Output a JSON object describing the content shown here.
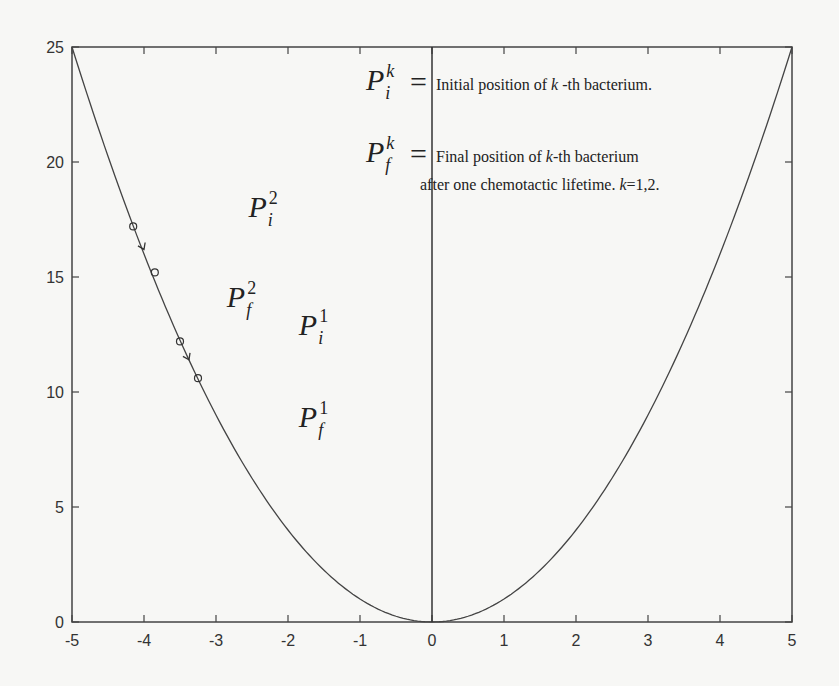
{
  "chart_data": {
    "type": "line",
    "title": "",
    "xlabel": "",
    "ylabel": "",
    "xlim": [
      -5,
      5
    ],
    "ylim": [
      0,
      25
    ],
    "grid": false,
    "x_ticks": [
      "-5",
      "-4",
      "-3",
      "-2",
      "-1",
      "0",
      "1",
      "2",
      "3",
      "4",
      "5"
    ],
    "y_ticks": [
      "0",
      "5",
      "10",
      "15",
      "20",
      "25"
    ],
    "series": [
      {
        "name": "f(x) = x^2",
        "function": "x^2",
        "x": [
          -5,
          -4,
          -3,
          -2,
          -1,
          0,
          1,
          2,
          3,
          4,
          5
        ],
        "values": [
          25,
          16,
          9,
          4,
          1,
          0,
          1,
          4,
          9,
          16,
          25
        ]
      }
    ],
    "vertical_line_x": 0,
    "bacteria_markers": [
      {
        "id": 2,
        "initial": {
          "x": -4.15,
          "y": 17.2
        },
        "final": {
          "x": -3.85,
          "y": 15.2
        }
      },
      {
        "id": 1,
        "initial": {
          "x": -3.5,
          "y": 12.2
        },
        "final": {
          "x": -3.25,
          "y": 10.6
        }
      }
    ],
    "point_labels": [
      {
        "text": "P",
        "sub": "i",
        "sup": "2",
        "x": -2.55,
        "y": 17.6
      },
      {
        "text": "P",
        "sub": "f",
        "sup": "2",
        "x": -2.85,
        "y": 13.7
      },
      {
        "text": "P",
        "sub": "i",
        "sup": "1",
        "x": -1.85,
        "y": 12.5
      },
      {
        "text": "P",
        "sub": "f",
        "sup": "1",
        "x": -1.85,
        "y": 8.5
      }
    ],
    "annotations": {
      "line1_symbol": {
        "text": "P",
        "sub": "i",
        "sup": "k"
      },
      "line1_eq": "=",
      "line1_text_a": "Initial position of ",
      "line1_text_k": "k",
      "line1_text_b": " -th bacterium.",
      "line2_symbol": {
        "text": "P",
        "sub": "f",
        "sup": "k"
      },
      "line2_eq": "=",
      "line2_text_a": "Final position of ",
      "line2_text_k": "k",
      "line2_text_b": "-th bacterium",
      "line3_text_a": "after one chemotactic lifetime. ",
      "line3_text_k": "k",
      "line3_text_b": "=1,2."
    }
  }
}
